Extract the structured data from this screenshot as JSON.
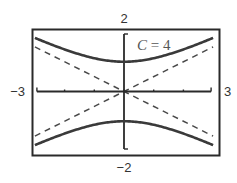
{
  "chart_data": {
    "type": "line",
    "title": "",
    "annotation": {
      "variable": "C",
      "equals": " = ",
      "value": "4"
    },
    "xlabel": "",
    "ylabel": "",
    "xlim": [
      -3,
      3
    ],
    "ylim": [
      -2,
      2
    ],
    "window_labels": {
      "xmin": "−3",
      "xmax": "3",
      "ymin": "−2",
      "ymax": "2"
    },
    "x_ticks": [
      -3,
      -2,
      -1,
      0,
      1,
      2,
      3
    ],
    "y_ticks": [
      -2,
      -1,
      0,
      1,
      2
    ],
    "grid": false,
    "legend": null,
    "series": [
      {
        "name": "upper branch",
        "equation": "y^2 - x^2/4 = 1 (y > 0)",
        "style": "solid",
        "x": [
          -3,
          -2.5,
          -2,
          -1.5,
          -1,
          -0.5,
          0,
          0.5,
          1,
          1.5,
          2,
          2.5,
          3
        ],
        "y": [
          1.8,
          1.6,
          1.41,
          1.25,
          1.12,
          1.03,
          1.0,
          1.03,
          1.12,
          1.25,
          1.41,
          1.6,
          1.8
        ]
      },
      {
        "name": "lower branch",
        "equation": "y^2 - x^2/4 = 1 (y < 0)",
        "style": "solid",
        "x": [
          -3,
          -2.5,
          -2,
          -1.5,
          -1,
          -0.5,
          0,
          0.5,
          1,
          1.5,
          2,
          2.5,
          3
        ],
        "y": [
          -1.8,
          -1.6,
          -1.41,
          -1.25,
          -1.12,
          -1.03,
          -1.0,
          -1.03,
          -1.12,
          -1.25,
          -1.41,
          -1.6,
          -1.8
        ]
      },
      {
        "name": "asymptote y = x/2",
        "style": "dashed",
        "x": [
          -3,
          3
        ],
        "y": [
          -1.5,
          1.5
        ]
      },
      {
        "name": "asymptote y = -x/2",
        "style": "dashed",
        "x": [
          -3,
          3
        ],
        "y": [
          1.5,
          -1.5
        ]
      }
    ],
    "colors": {
      "curve": "#3a3a3a",
      "asymptote": "#4a4a4a",
      "axis": "#2a2a2a",
      "frame": "#2a2a2a",
      "label": "#333333"
    }
  }
}
